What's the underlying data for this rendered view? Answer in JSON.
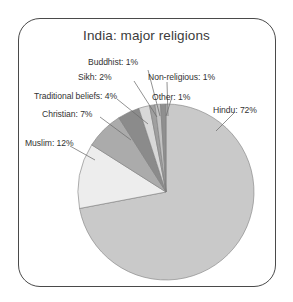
{
  "chart_data": {
    "type": "pie",
    "title": "India: major religions",
    "xlabel": "",
    "ylabel": "",
    "legend_position": "callout-labels",
    "grid": false,
    "unit": "%",
    "start_angle_deg": 0,
    "direction": "clockwise",
    "categories": [
      "Hindu",
      "Muslim",
      "Christian",
      "Traditional beliefs",
      "Sikh",
      "Buddhist",
      "Non-religious",
      "Other"
    ],
    "values": [
      72,
      12,
      7,
      4,
      2,
      1,
      1,
      1
    ],
    "slices": [
      {
        "name": "Hindu",
        "value": 72,
        "label": "Hindu: 72%",
        "color": "#c9c9c9"
      },
      {
        "name": "Muslim",
        "value": 12,
        "label": "Muslim: 12%",
        "color": "#ededed"
      },
      {
        "name": "Christian",
        "value": 7,
        "label": "Christian: 7%",
        "color": "#ababab"
      },
      {
        "name": "Traditional beliefs",
        "value": 4,
        "label": "Traditional beliefs: 4%",
        "color": "#8b8b8b"
      },
      {
        "name": "Sikh",
        "value": 2,
        "label": "Sikh: 2%",
        "color": "#d8d8d8"
      },
      {
        "name": "Buddhist",
        "value": 1,
        "label": "Buddhist: 1%",
        "color": "#9f9f9f"
      },
      {
        "name": "Non-religious",
        "value": 1,
        "label": "Non-religious: 1%",
        "color": "#c2c2c2"
      },
      {
        "name": "Other",
        "value": 1,
        "label": "Other: 1%",
        "color": "#8f8f8f"
      }
    ]
  },
  "figure": {
    "title": "India: major religions",
    "border_color": "#4a4a4a",
    "background": "#ffffff",
    "text_color": "#333333"
  },
  "labels": {
    "hindu": "Hindu: 72%",
    "muslim": "Muslim: 12%",
    "christian": "Christian: 7%",
    "traditional": "Traditional beliefs: 4%",
    "sikh": "Sikh: 2%",
    "buddhist": "Buddhist: 1%",
    "nonreligious": "Non-religious: 1%",
    "other": "Other: 1%"
  }
}
